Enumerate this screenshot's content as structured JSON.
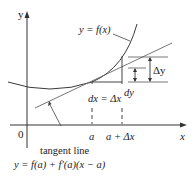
{
  "diagram": {
    "axes": {
      "x_label": "x",
      "y_label": "y",
      "origin_label": "0"
    },
    "curve_label": "y = f(x)",
    "tangent_label": "tangent line",
    "tangent_equation": "y = f(a) + f′(a)(x − a)",
    "x_ticks": [
      "a",
      "a + Δx"
    ],
    "dx_label": "dx = Δx",
    "dy_label": "dy",
    "delta_y_label": "Δy",
    "colors": {
      "curve": "#3a3a3a",
      "tangent": "#666666",
      "axis": "#333333"
    }
  }
}
